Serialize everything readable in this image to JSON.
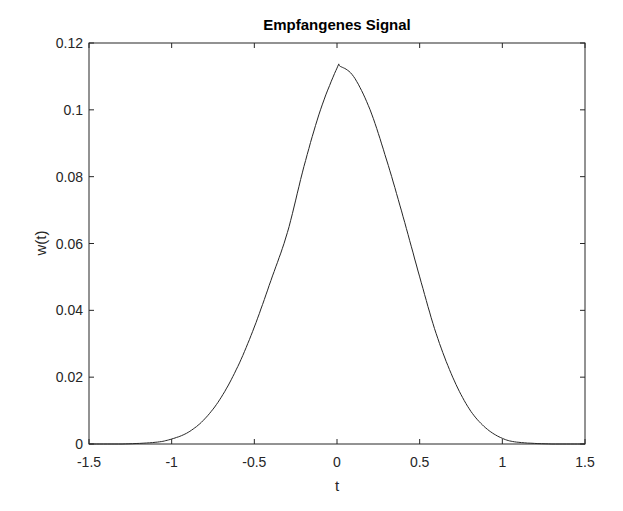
{
  "chart_data": {
    "type": "line",
    "title": "Empfangenes Signal",
    "xlabel": "t",
    "ylabel": "w(t)",
    "xlim": [
      -1.5,
      1.5
    ],
    "ylim": [
      0,
      0.12
    ],
    "xticks": [
      -1.5,
      -1,
      -0.5,
      0,
      0.5,
      1,
      1.5
    ],
    "xtick_labels": [
      "-1.5",
      "-1",
      "-0.5",
      "0",
      "0.5",
      "1",
      "1.5"
    ],
    "yticks": [
      0,
      0.02,
      0.04,
      0.06,
      0.08,
      0.1,
      0.12
    ],
    "ytick_labels": [
      "0",
      "0.02",
      "0.04",
      "0.06",
      "0.08",
      "0.1",
      "0.12"
    ],
    "grid": false,
    "box": true,
    "line_color": "#262626",
    "series": [
      {
        "name": "w(t)",
        "x": [
          -1.5,
          -1.3,
          -1.1,
          -1.0,
          -0.9,
          -0.8,
          -0.7,
          -0.6,
          -0.5,
          -0.4,
          -0.3,
          -0.2,
          -0.1,
          0.0,
          0.02,
          0.1,
          0.2,
          0.3,
          0.4,
          0.5,
          0.6,
          0.7,
          0.8,
          0.9,
          1.0,
          1.1,
          1.3,
          1.5
        ],
        "values": [
          0.0,
          0.0,
          0.0005,
          0.0015,
          0.0035,
          0.0075,
          0.014,
          0.0232,
          0.035,
          0.0489,
          0.0633,
          0.083,
          0.1,
          0.1125,
          0.113,
          0.11,
          0.1,
          0.085,
          0.068,
          0.05,
          0.033,
          0.02,
          0.0105,
          0.0048,
          0.0017,
          0.0005,
          0.0,
          0.0
        ]
      }
    ]
  }
}
